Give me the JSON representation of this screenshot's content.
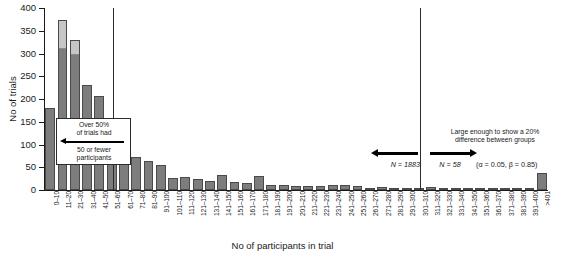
{
  "chart_data": {
    "type": "bar",
    "title": "",
    "xlabel": "No of participants in trial",
    "ylabel": "No of trials",
    "ylim": [
      0,
      400
    ],
    "yticks": [
      0,
      50,
      100,
      150,
      200,
      250,
      300,
      350,
      400
    ],
    "grid": false,
    "legend_position": "none",
    "stacked": true,
    "categories": [
      "0–10",
      "11–20",
      "21–30",
      "31–40",
      "41–50",
      "51–60",
      "61–70",
      "71–80",
      "81–90",
      "91–100",
      "101–110",
      "111–120",
      "121–130",
      "131–140",
      "141–150",
      "151–160",
      "161–170",
      "171–180",
      "181–190",
      "191–200",
      "201–210",
      "211–220",
      "221–230",
      "231–240",
      "241–250",
      "251–260",
      "261–270",
      "271–280",
      "281–290",
      "291–300",
      "301–310",
      "311–320",
      "321–330",
      "331–340",
      "341–350",
      "351–360",
      "361–370",
      "371–380",
      "381–390",
      "391–400",
      ">401"
    ],
    "series": [
      {
        "name": "dark",
        "color": "#7d7d7d",
        "values": [
          180,
          312,
          298,
          230,
          206,
          140,
          65,
          72,
          63,
          54,
          26,
          28,
          25,
          19,
          33,
          17,
          16,
          30,
          12,
          12,
          9,
          9,
          9,
          10,
          10,
          9,
          5,
          6,
          4,
          3,
          3,
          6,
          5,
          4,
          3,
          1,
          4,
          3,
          1,
          1,
          37
        ]
      },
      {
        "name": "light",
        "color": "#c6c6c6",
        "values": [
          0,
          62,
          32,
          0,
          0,
          0,
          0,
          0,
          0,
          0,
          0,
          0,
          0,
          0,
          0,
          0,
          0,
          0,
          0,
          0,
          0,
          0,
          0,
          0,
          0,
          0,
          0,
          0,
          0,
          0,
          0,
          0,
          0,
          0,
          0,
          0,
          0,
          0,
          0,
          0,
          0
        ]
      }
    ],
    "totals": [
      180,
      374,
      330,
      230,
      206,
      140,
      65,
      72,
      63,
      54,
      26,
      28,
      25,
      19,
      33,
      17,
      16,
      30,
      12,
      12,
      9,
      9,
      9,
      10,
      10,
      9,
      5,
      6,
      4,
      3,
      3,
      6,
      5,
      4,
      3,
      1,
      4,
      3,
      1,
      1,
      37
    ],
    "reference_lines": [
      {
        "name": "n58-line",
        "category_index": 5
      },
      {
        "name": "n1883-line",
        "category_index": 30
      }
    ],
    "annotations": {
      "left_callout": {
        "line1": "Over 50%",
        "line2": "of trials had",
        "line3": "50 or fewer",
        "line4": "participants",
        "arrow": "left-arrow-icon"
      },
      "right_note": {
        "line1": "Large enough to show a 20%",
        "line2": "difference between groups"
      },
      "n_left": "N = 1883",
      "n_right": "N = 58",
      "alpha_beta": "(α = 0.05, β = 0.85)"
    }
  }
}
